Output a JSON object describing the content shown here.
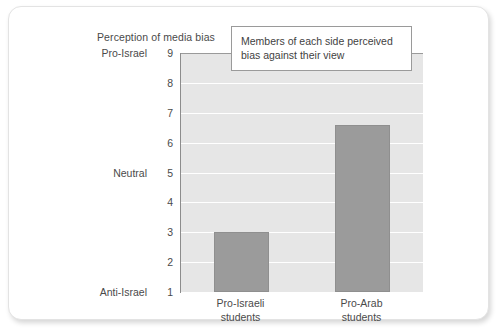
{
  "chart_data": {
    "type": "bar",
    "title": "Perception of media bias",
    "xlabel": "",
    "ylabel": "",
    "categories": [
      "Pro-Israeli students",
      "Pro-Arab students"
    ],
    "category_lines": [
      [
        "Pro-Israeli",
        "students"
      ],
      [
        "Pro-Arab",
        "students"
      ]
    ],
    "values": [
      3.0,
      6.6
    ],
    "ylim": [
      1,
      9
    ],
    "yticks": [
      1,
      2,
      3,
      4,
      5,
      6,
      7,
      8,
      9
    ],
    "ytick_labels": [
      "1",
      "2",
      "3",
      "4",
      "5",
      "6",
      "7",
      "8",
      "9"
    ],
    "y_category_labels": [
      {
        "value": 9,
        "label": "Pro-Israel"
      },
      {
        "value": 5,
        "label": "Neutral"
      },
      {
        "value": 1,
        "label": "Anti-Israel"
      }
    ],
    "grid": true,
    "legend": false,
    "annotations": [
      {
        "text": "Members of each side perceived bias against their view"
      }
    ],
    "colors": {
      "bar_fill": "#9b9b9b",
      "bar_stroke": "#8f8f8f",
      "plot_background": "#e6e6e6",
      "gridline": "#ffffff",
      "axis_line": "#8c8c8c",
      "text": "#4a4a4a",
      "card_background": "#ffffff",
      "card_border": "#e3e3e3",
      "callout_border": "#9a9a9a"
    }
  }
}
